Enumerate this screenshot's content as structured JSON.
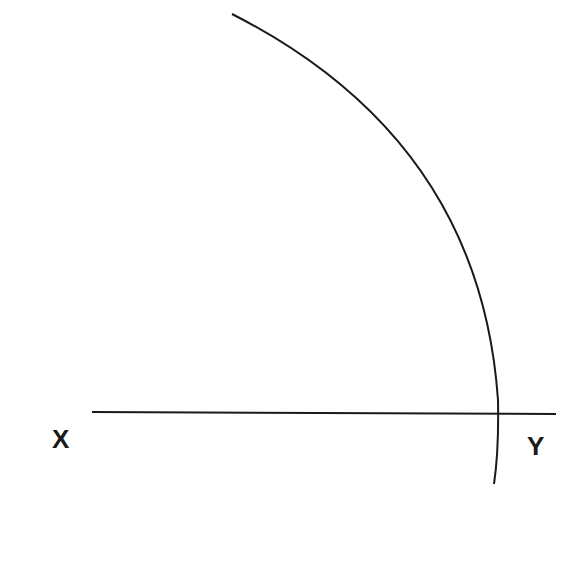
{
  "diagram": {
    "line": {
      "start_label": "X",
      "end_label": "Y"
    },
    "arc": {
      "description": "circular arc intersecting line XY near Y"
    },
    "colors": {
      "stroke": "#1a1a1a",
      "background": "#ffffff"
    }
  }
}
